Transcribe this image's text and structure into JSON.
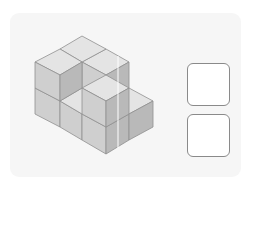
{
  "figure": {
    "colors": {
      "top": "#e4e4e4",
      "left": "#cfcfcf",
      "right": "#b9b9b9",
      "edge": "#8f8f8f",
      "panel": "#f6f6f6"
    }
  },
  "answers": {
    "boxes": [
      {
        "label": "",
        "value": ""
      },
      {
        "label": "",
        "value": ""
      }
    ]
  }
}
